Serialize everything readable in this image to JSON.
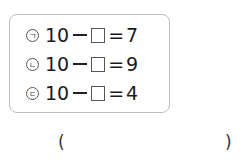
{
  "equations": [
    {
      "marker": "ㄱ",
      "minuend": "10",
      "operator": "−",
      "blank": "□",
      "equals": "=",
      "result": "7"
    },
    {
      "marker": "ㄴ",
      "minuend": "10",
      "operator": "−",
      "blank": "□",
      "equals": "=",
      "result": "9"
    },
    {
      "marker": "ㄷ",
      "minuend": "10",
      "operator": "−",
      "blank": "□",
      "equals": "=",
      "result": "4"
    }
  ],
  "answer": {
    "open": "(",
    "close": ")",
    "value": ""
  }
}
